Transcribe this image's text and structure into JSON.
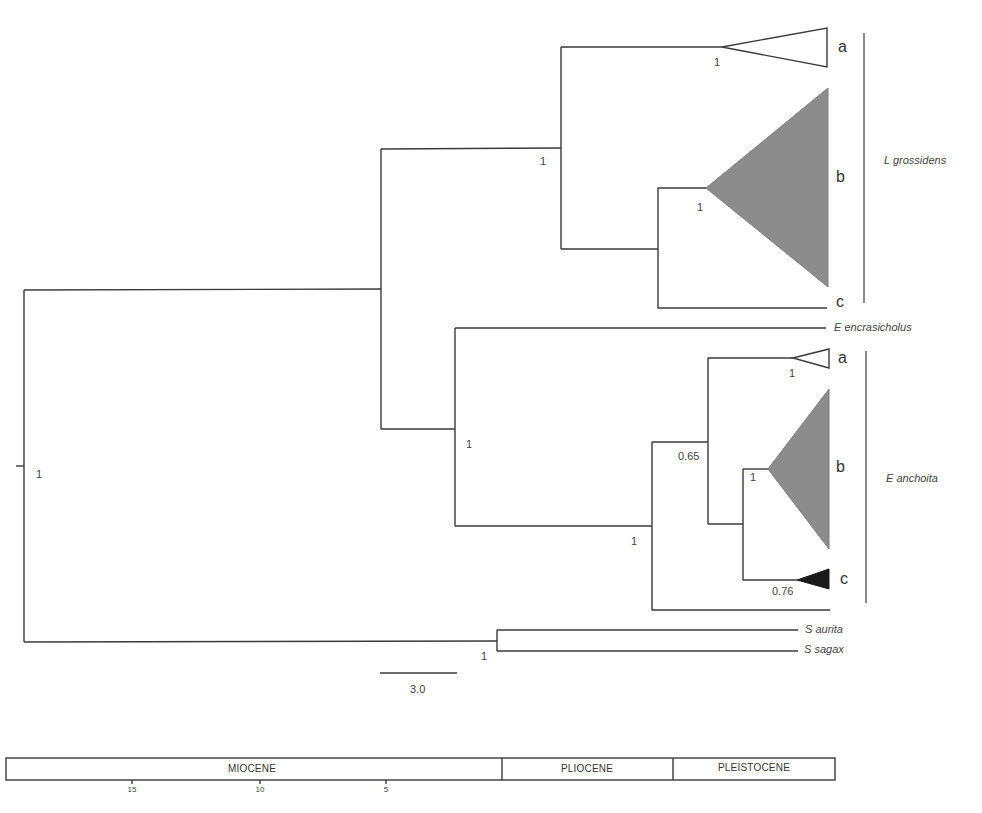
{
  "figure": {
    "type": "phylogenetic-tree",
    "scale_bar": {
      "label": "3.0"
    },
    "root_support": "1",
    "groups": {
      "l_grossidens": {
        "label": "L grossidens",
        "clades": {
          "a": "a",
          "b": "b",
          "c": "c"
        },
        "supports": {
          "group": "1",
          "a": "1",
          "b": "1"
        }
      },
      "e_anchoita": {
        "label": "E anchoita",
        "clades": {
          "a": "a",
          "b": "b",
          "c": "c"
        },
        "supports": {
          "group": "1",
          "ab_node": "0.65",
          "a": "1",
          "b": "1",
          "c": "0.76"
        }
      }
    },
    "engraulis_node_support": "1",
    "outgroup_support": "1",
    "taxa": {
      "e_encrasicholus": "E encrasicholus",
      "s_aurita": "S aurita",
      "s_sagax": "S sagax"
    },
    "timescale": {
      "epochs": [
        {
          "label": "MIOCENE"
        },
        {
          "label": "PLIOCENE"
        },
        {
          "label": "PLEISTOCENE"
        }
      ],
      "ticks": [
        "15",
        "10",
        "5"
      ]
    },
    "colors": {
      "branch": "#3a3a3a",
      "clade_open": "#ffffff",
      "clade_grey": "#8c8c8c",
      "clade_black": "#1a1a1a"
    }
  }
}
